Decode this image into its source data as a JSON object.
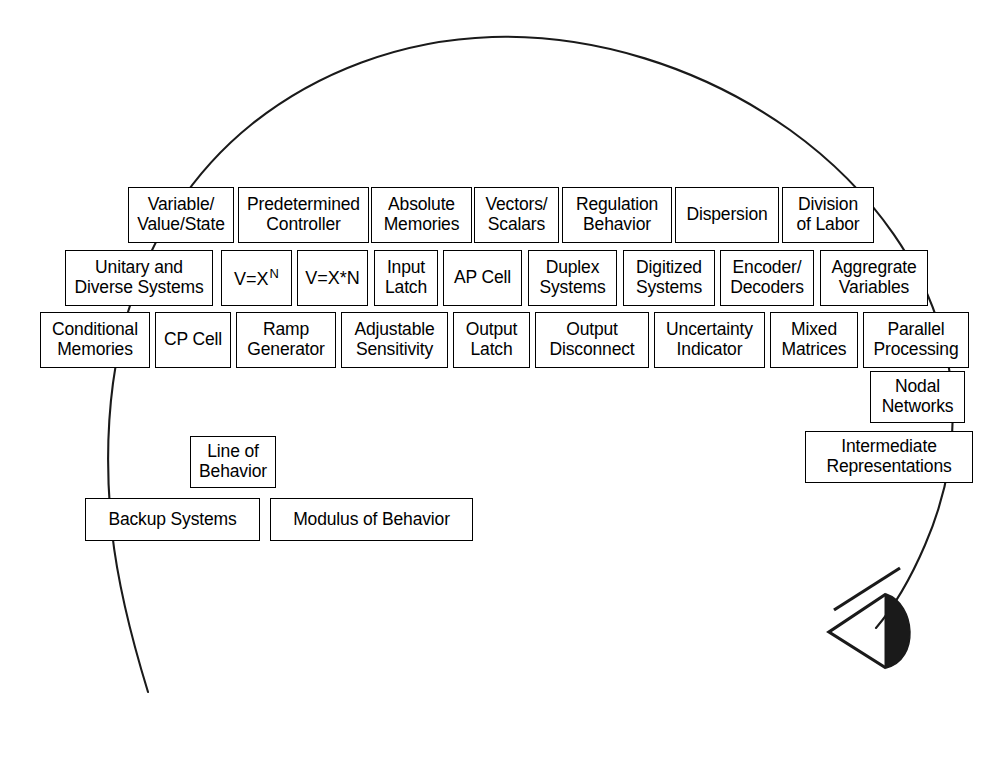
{
  "figure": {
    "stroke_color": "#000000",
    "fill_color": "#ffffff",
    "eye_fill_color": "#1a1a1a"
  },
  "head": {
    "outline_name": "head-profile-outline",
    "nose_name": "nose-line",
    "eye_name": "eye-wedge"
  },
  "rows": [
    {
      "name": "row-1",
      "boxes": [
        {
          "name": "module-variable-value-state",
          "label": "Variable/\nValue/State",
          "x": 128,
          "y": 187,
          "w": 106,
          "h": 56
        },
        {
          "name": "module-predetermined-controller",
          "label": "Predetermined\nController",
          "x": 238,
          "y": 187,
          "w": 131,
          "h": 56
        },
        {
          "name": "module-absolute-memories",
          "label": "Absolute\nMemories",
          "x": 371,
          "y": 187,
          "w": 101,
          "h": 56
        },
        {
          "name": "module-vectors-scalars",
          "label": "Vectors/\nScalars",
          "x": 474,
          "y": 187,
          "w": 85,
          "h": 56
        },
        {
          "name": "module-regulation-behavior",
          "label": "Regulation\nBehavior",
          "x": 562,
          "y": 187,
          "w": 110,
          "h": 56
        },
        {
          "name": "module-dispersion",
          "label": "Dispersion",
          "x": 675,
          "y": 187,
          "w": 104,
          "h": 56
        },
        {
          "name": "module-division-of-labor",
          "label": "Division\nof Labor",
          "x": 782,
          "y": 187,
          "w": 92,
          "h": 56
        }
      ]
    },
    {
      "name": "row-2",
      "boxes": [
        {
          "name": "module-unitary-and-diverse-systems",
          "label": "Unitary and\nDiverse Systems",
          "x": 65,
          "y": 250,
          "w": 148,
          "h": 56
        },
        {
          "name": "module-v-equals-x-power-n",
          "label": "V=X",
          "superscript": "N",
          "formula": true,
          "x": 221,
          "y": 250,
          "w": 71,
          "h": 56
        },
        {
          "name": "module-v-equals-x-times-n",
          "label": "V=X*N",
          "formula": true,
          "x": 297,
          "y": 250,
          "w": 71,
          "h": 56
        },
        {
          "name": "module-input-latch",
          "label": "Input\nLatch",
          "x": 374,
          "y": 250,
          "w": 64,
          "h": 56
        },
        {
          "name": "module-ap-cell",
          "label": "AP Cell",
          "x": 443,
          "y": 250,
          "w": 79,
          "h": 56
        },
        {
          "name": "module-duplex-systems",
          "label": "Duplex\nSystems",
          "x": 528,
          "y": 250,
          "w": 89,
          "h": 56
        },
        {
          "name": "module-digitized-systems",
          "label": "Digitized\nSystems",
          "x": 623,
          "y": 250,
          "w": 92,
          "h": 56
        },
        {
          "name": "module-encoder-decoders",
          "label": "Encoder/\nDecoders",
          "x": 720,
          "y": 250,
          "w": 94,
          "h": 56
        },
        {
          "name": "module-aggregrate-variables",
          "label": "Aggregrate\nVariables",
          "x": 820,
          "y": 250,
          "w": 108,
          "h": 56
        }
      ]
    },
    {
      "name": "row-3",
      "boxes": [
        {
          "name": "module-conditional-memories",
          "label": "Conditional\nMemories",
          "x": 40,
          "y": 312,
          "w": 110,
          "h": 56
        },
        {
          "name": "module-cp-cell",
          "label": "CP Cell",
          "x": 155,
          "y": 312,
          "w": 76,
          "h": 56
        },
        {
          "name": "module-ramp-generator",
          "label": "Ramp\nGenerator",
          "x": 236,
          "y": 312,
          "w": 100,
          "h": 56
        },
        {
          "name": "module-adjustable-sensitivity",
          "label": "Adjustable\nSensitivity",
          "x": 341,
          "y": 312,
          "w": 107,
          "h": 56
        },
        {
          "name": "module-output-latch",
          "label": "Output\nLatch",
          "x": 453,
          "y": 312,
          "w": 77,
          "h": 56
        },
        {
          "name": "module-output-disconnect",
          "label": "Output\nDisconnect",
          "x": 535,
          "y": 312,
          "w": 114,
          "h": 56
        },
        {
          "name": "module-uncertainty-indicator",
          "label": "Uncertainty\nIndicator",
          "x": 654,
          "y": 312,
          "w": 111,
          "h": 56
        },
        {
          "name": "module-mixed-matrices",
          "label": "Mixed\nMatrices",
          "x": 770,
          "y": 312,
          "w": 88,
          "h": 56
        },
        {
          "name": "module-parallel-processing",
          "label": "Parallel\nProcessing",
          "x": 863,
          "y": 312,
          "w": 106,
          "h": 56
        }
      ]
    },
    {
      "name": "row-4-right",
      "boxes": [
        {
          "name": "module-nodal-networks",
          "label": "Nodal\nNetworks",
          "x": 870,
          "y": 371,
          "w": 95,
          "h": 52
        },
        {
          "name": "module-intermediate-representations",
          "label": "Intermediate\nRepresentations",
          "x": 805,
          "y": 431,
          "w": 168,
          "h": 52
        }
      ]
    },
    {
      "name": "row-5-left",
      "boxes": [
        {
          "name": "module-line-of-behavior",
          "label": "Line of\nBehavior",
          "x": 190,
          "y": 436,
          "w": 86,
          "h": 52
        },
        {
          "name": "module-backup-systems",
          "label": "Backup Systems",
          "x": 85,
          "y": 498,
          "w": 175,
          "h": 43
        },
        {
          "name": "module-modulus-of-behavior",
          "label": "Modulus of Behavior",
          "x": 270,
          "y": 498,
          "w": 203,
          "h": 43
        }
      ]
    }
  ]
}
